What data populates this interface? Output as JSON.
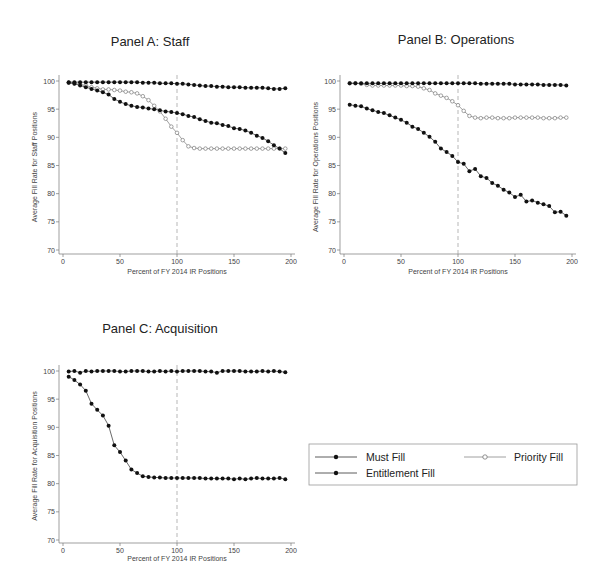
{
  "chart_data": [
    {
      "type": "line",
      "title": "Panel A: Staff",
      "xlabel": "Percent of FY 2014 IR Positions",
      "ylabel": "Average Fill Rate for Staff Positions",
      "xlim": [
        0,
        200
      ],
      "ylim": [
        70,
        100
      ],
      "xticks": [
        0,
        50,
        100,
        150,
        200
      ],
      "yticks": [
        70,
        75,
        80,
        85,
        90,
        95,
        100
      ],
      "vline": 100,
      "x": [
        5,
        10,
        15,
        20,
        25,
        30,
        35,
        40,
        45,
        50,
        55,
        60,
        65,
        70,
        75,
        80,
        85,
        90,
        95,
        100,
        105,
        110,
        115,
        120,
        125,
        130,
        135,
        140,
        145,
        150,
        155,
        160,
        165,
        170,
        175,
        180,
        185,
        190,
        195
      ],
      "series": [
        {
          "name": "Must Fill",
          "marker": "filled",
          "values": [
            99.8,
            99.8,
            99.8,
            99.8,
            99.8,
            99.8,
            99.8,
            99.8,
            99.8,
            99.8,
            99.8,
            99.8,
            99.8,
            99.7,
            99.7,
            99.7,
            99.6,
            99.6,
            99.6,
            99.5,
            99.5,
            99.4,
            99.3,
            99.2,
            99.1,
            99.1,
            99.0,
            99.0,
            98.9,
            98.9,
            98.9,
            98.8,
            98.8,
            98.8,
            98.8,
            98.7,
            98.6,
            98.6,
            98.7
          ]
        },
        {
          "name": "Entitlement Fill",
          "marker": "filled",
          "values": [
            99.7,
            99.5,
            99.2,
            98.9,
            98.6,
            98.3,
            98.0,
            97.6,
            96.8,
            96.3,
            95.9,
            95.6,
            95.4,
            95.3,
            95.1,
            95.0,
            94.8,
            94.6,
            94.5,
            94.3,
            94.1,
            93.8,
            93.6,
            93.2,
            92.9,
            92.6,
            92.5,
            92.2,
            92.0,
            91.6,
            91.5,
            91.2,
            90.8,
            90.3,
            89.9,
            89.3,
            88.6,
            88.0,
            87.2
          ]
        },
        {
          "name": "Priority Fill",
          "marker": "hollow",
          "values": [
            99.7,
            99.6,
            99.4,
            99.2,
            98.9,
            98.7,
            98.5,
            98.5,
            98.4,
            98.3,
            98.1,
            98.0,
            97.8,
            97.3,
            96.6,
            95.6,
            94.6,
            93.3,
            91.9,
            90.8,
            89.5,
            88.4,
            88.1,
            88.0,
            88.0,
            88.0,
            88.0,
            88.0,
            88.0,
            88.0,
            88.0,
            88.0,
            88.0,
            88.0,
            88.0,
            88.0,
            88.0,
            88.0,
            88.0
          ]
        }
      ]
    },
    {
      "type": "line",
      "title": "Panel B: Operations",
      "xlabel": "Percent of FY 2014 IR Positions",
      "ylabel": "Average Fill Rate for Operations Positions",
      "xlim": [
        0,
        200
      ],
      "ylim": [
        70,
        100
      ],
      "xticks": [
        0,
        50,
        100,
        150,
        200
      ],
      "yticks": [
        70,
        75,
        80,
        85,
        90,
        95,
        100
      ],
      "vline": 100,
      "x": [
        5,
        10,
        15,
        20,
        25,
        30,
        35,
        40,
        45,
        50,
        55,
        60,
        65,
        70,
        75,
        80,
        85,
        90,
        95,
        100,
        105,
        110,
        115,
        120,
        125,
        130,
        135,
        140,
        145,
        150,
        155,
        160,
        165,
        170,
        175,
        180,
        185,
        190,
        195
      ],
      "series": [
        {
          "name": "Must Fill",
          "marker": "filled",
          "values": [
            99.6,
            99.6,
            99.6,
            99.6,
            99.6,
            99.6,
            99.6,
            99.6,
            99.6,
            99.6,
            99.6,
            99.6,
            99.6,
            99.6,
            99.6,
            99.6,
            99.6,
            99.6,
            99.6,
            99.6,
            99.6,
            99.6,
            99.6,
            99.5,
            99.5,
            99.5,
            99.5,
            99.5,
            99.5,
            99.4,
            99.4,
            99.4,
            99.4,
            99.4,
            99.3,
            99.3,
            99.3,
            99.3,
            99.2
          ]
        },
        {
          "name": "Entitlement Fill",
          "marker": "filled",
          "values": [
            95.8,
            95.6,
            95.5,
            95.1,
            94.8,
            94.5,
            94.3,
            93.9,
            93.5,
            93.1,
            92.6,
            91.9,
            91.5,
            90.8,
            90.1,
            89.2,
            88.0,
            87.4,
            86.7,
            85.6,
            85.3,
            84.0,
            84.4,
            83.1,
            82.8,
            81.9,
            81.4,
            80.7,
            80.2,
            79.4,
            79.8,
            78.6,
            78.8,
            78.4,
            78.1,
            77.8,
            76.7,
            76.8,
            76.1
          ]
        },
        {
          "name": "Priority Fill",
          "marker": "hollow",
          "values": [
            99.6,
            99.6,
            99.5,
            99.3,
            99.2,
            99.2,
            99.2,
            99.2,
            99.2,
            99.2,
            99.1,
            99.1,
            99.0,
            98.7,
            98.4,
            97.8,
            97.4,
            97.0,
            96.4,
            95.7,
            94.7,
            93.8,
            93.5,
            93.4,
            93.5,
            93.5,
            93.4,
            93.4,
            93.4,
            93.5,
            93.5,
            93.5,
            93.5,
            93.5,
            93.4,
            93.4,
            93.4,
            93.5,
            93.5
          ]
        }
      ]
    },
    {
      "type": "line",
      "title": "Panel C: Acquisition",
      "xlabel": "Percent of FY 2014 IR Positions",
      "ylabel": "Average Fill Rate for Acquisition Positions",
      "xlim": [
        0,
        200
      ],
      "ylim": [
        70,
        100
      ],
      "xticks": [
        0,
        50,
        100,
        150,
        200
      ],
      "yticks": [
        70,
        75,
        80,
        85,
        90,
        95,
        100
      ],
      "vline": 100,
      "x": [
        5,
        10,
        15,
        20,
        25,
        30,
        35,
        40,
        45,
        50,
        55,
        60,
        65,
        70,
        75,
        80,
        85,
        90,
        95,
        100,
        105,
        110,
        115,
        120,
        125,
        130,
        135,
        140,
        145,
        150,
        155,
        160,
        165,
        170,
        175,
        180,
        185,
        190,
        195
      ],
      "series": [
        {
          "name": "Must Fill",
          "marker": "filled",
          "values": [
            99.9,
            100.0,
            99.7,
            100.0,
            99.9,
            100.0,
            100.0,
            100.0,
            100.0,
            99.9,
            99.9,
            100.0,
            100.0,
            100.0,
            99.9,
            99.9,
            100.0,
            99.9,
            100.0,
            99.9,
            100.0,
            100.0,
            100.0,
            100.0,
            99.9,
            99.9,
            99.7,
            100.0,
            100.0,
            100.0,
            100.0,
            99.9,
            99.9,
            99.9,
            100.0,
            99.9,
            100.0,
            99.9,
            99.8
          ]
        },
        {
          "name": "Entitlement Fill",
          "marker": "filled",
          "values": [
            99.0,
            98.4,
            97.6,
            96.5,
            94.2,
            93.1,
            92.1,
            90.3,
            86.8,
            85.6,
            84.1,
            82.5,
            81.9,
            81.3,
            81.2,
            81.1,
            81.1,
            81.0,
            81.0,
            81.0,
            81.0,
            81.0,
            81.0,
            81.0,
            80.9,
            80.9,
            80.9,
            80.9,
            80.9,
            80.8,
            80.9,
            80.8,
            80.9,
            81.0,
            80.9,
            80.9,
            80.9,
            81.0,
            80.8
          ]
        }
      ]
    }
  ],
  "legend": {
    "items": [
      {
        "label": "Must Fill",
        "marker": "filled"
      },
      {
        "label": "Priority Fill",
        "marker": "hollow"
      },
      {
        "label": "Entitlement Fill",
        "marker": "filled"
      }
    ]
  },
  "panels": {
    "a": {
      "title": "Panel A: Staff",
      "ylabel": "Average Fill Rate for Staff Positions",
      "xlabel": "Percent of FY 2014 IR Positions"
    },
    "b": {
      "title": "Panel B: Operations",
      "ylabel": "Average Fill Rate for Operations Positions",
      "xlabel": "Percent of FY 2014 IR Positions"
    },
    "c": {
      "title": "Panel C: Acquisition",
      "ylabel": "Average Fill Rate for Acquisition Positions",
      "xlabel": "Percent of FY 2014 IR Positions"
    }
  }
}
